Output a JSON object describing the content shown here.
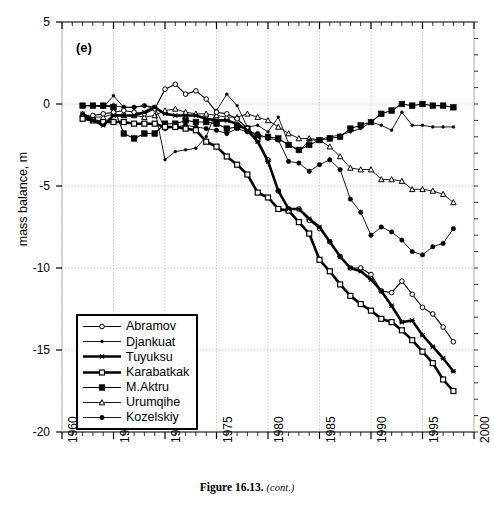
{
  "figure": {
    "panel_label": "(e)",
    "caption_number": "Figure 16.13.",
    "caption_cont": "(cont.)"
  },
  "axes": {
    "ylabel": "mass balance, m",
    "xlabel": "",
    "y_ticks": [
      "5",
      "0",
      "-5",
      "-10",
      "-15",
      "-20"
    ],
    "x_ticks": [
      "1960",
      "1965",
      "1970",
      "1975",
      "1980",
      "1985",
      "1990",
      "1995",
      "2000"
    ]
  },
  "legend": {
    "items": [
      {
        "label": "Abramov",
        "marker": "open-circle",
        "lw": 1.1,
        "ms": 4.6
      },
      {
        "label": "Djankuat",
        "marker": "small-dot",
        "lw": 0.9,
        "ms": 2.9
      },
      {
        "label": "Tuyuksu",
        "marker": "cross-x",
        "lw": 2.6,
        "ms": 4.2
      },
      {
        "label": "Karabatkak",
        "marker": "open-square",
        "lw": 2.6,
        "ms": 5.0
      },
      {
        "label": "M.Aktru",
        "marker": "filled-square",
        "lw": 1.1,
        "ms": 5.6
      },
      {
        "label": "Urumqihe",
        "marker": "open-triangle",
        "lw": 0.9,
        "ms": 4.6
      },
      {
        "label": "Kozelskiy",
        "marker": "filled-circle",
        "lw": 0.9,
        "ms": 4.4
      }
    ]
  },
  "chart_data": {
    "type": "line",
    "title": "",
    "subtitle": "",
    "xlabel": "",
    "ylabel": "mass balance, m",
    "xlim": [
      1960,
      2000
    ],
    "ylim": [
      -20,
      5
    ],
    "y_major_step": 5,
    "x_major_step": 5,
    "x_minor_step": 1,
    "grid": "dotted gridlines at major x and y values",
    "legend_position": "lower-left inside axes",
    "annotations": [
      "(e)"
    ],
    "series": [
      {
        "name": "Abramov",
        "color": "#000000",
        "marker": "open-circle",
        "x": [
          1962,
          1963,
          1964,
          1965,
          1966,
          1967,
          1968,
          1969,
          1970,
          1971,
          1972,
          1973,
          1974,
          1975,
          1976,
          1977,
          1978,
          1979,
          1980,
          1981,
          1982,
          1983,
          1984,
          1985,
          1986,
          1987,
          1988,
          1989,
          1990,
          1991,
          1992,
          1993,
          1994,
          1995,
          1996,
          1997,
          1998
        ],
        "y": [
          -0.8,
          -0.7,
          -0.6,
          -0.5,
          -0.4,
          -0.5,
          -0.6,
          -0.3,
          0.9,
          1.2,
          0.6,
          0.8,
          0.3,
          -0.5,
          -0.6,
          -0.9,
          -1.5,
          -2.2,
          -3.4,
          -5.3,
          -6.4,
          -6.4,
          -7.1,
          -7.6,
          -8.4,
          -9.3,
          -10.0,
          -10.0,
          -10.4,
          -11.4,
          -11.5,
          -10.8,
          -11.6,
          -12.4,
          -12.8,
          -13.6,
          -14.5
        ]
      },
      {
        "name": "Djankuat",
        "color": "#000000",
        "marker": "small-dot",
        "x": [
          1962,
          1963,
          1964,
          1965,
          1966,
          1967,
          1968,
          1969,
          1970,
          1971,
          1972,
          1973,
          1974,
          1975,
          1976,
          1977,
          1978,
          1979,
          1980,
          1981,
          1982,
          1983,
          1984,
          1985,
          1986,
          1987,
          1988,
          1989,
          1990,
          1991,
          1992,
          1993,
          1994,
          1995,
          1996,
          1997,
          1998
        ],
        "y": [
          -0.1,
          -0.1,
          -0.2,
          0.5,
          -0.2,
          -0.2,
          -0.1,
          -0.3,
          -3.4,
          -2.9,
          -2.8,
          -2.7,
          -2.0,
          -0.4,
          0.6,
          -0.1,
          -1.4,
          -1.3,
          -1.7,
          -0.8,
          -2.4,
          -2.9,
          -2.2,
          -2.2,
          -2.0,
          -1.9,
          -1.7,
          -1.5,
          -1.1,
          -1.3,
          -1.6,
          -0.5,
          -1.3,
          -1.3,
          -1.4,
          -1.4,
          -1.4
        ]
      },
      {
        "name": "Tuyuksu",
        "color": "#000000",
        "marker": "cross-x",
        "x": [
          1962,
          1963,
          1964,
          1965,
          1966,
          1967,
          1968,
          1969,
          1970,
          1971,
          1972,
          1973,
          1974,
          1975,
          1976,
          1977,
          1978,
          1979,
          1980,
          1981,
          1982,
          1983,
          1984,
          1985,
          1986,
          1987,
          1988,
          1989,
          1990,
          1991,
          1992,
          1993,
          1994,
          1995,
          1996,
          1997,
          1998
        ],
        "y": [
          -0.6,
          -1.0,
          -1.3,
          -0.7,
          -0.7,
          -0.7,
          -0.5,
          -0.2,
          -0.6,
          -0.7,
          -0.7,
          -0.7,
          -0.9,
          -1.0,
          -1.0,
          -1.2,
          -1.6,
          -2.3,
          -3.5,
          -5.3,
          -6.4,
          -6.4,
          -7.0,
          -7.5,
          -8.4,
          -9.3,
          -10.0,
          -10.2,
          -10.7,
          -11.4,
          -12.3,
          -13.3,
          -13.2,
          -14.1,
          -14.8,
          -15.5,
          -16.3
        ]
      },
      {
        "name": "Karabatkak",
        "color": "#000000",
        "marker": "open-square",
        "x": [
          1962,
          1963,
          1964,
          1965,
          1966,
          1967,
          1968,
          1969,
          1970,
          1971,
          1972,
          1973,
          1974,
          1975,
          1976,
          1977,
          1978,
          1979,
          1980,
          1981,
          1982,
          1983,
          1984,
          1985,
          1986,
          1987,
          1988,
          1989,
          1990,
          1991,
          1992,
          1993,
          1994,
          1995,
          1996,
          1997,
          1998
        ],
        "y": [
          -0.9,
          -1.0,
          -1.1,
          -1.1,
          -1.1,
          -1.2,
          -1.2,
          -1.2,
          -1.4,
          -1.4,
          -1.5,
          -1.6,
          -2.3,
          -2.6,
          -3.2,
          -3.7,
          -4.3,
          -5.4,
          -5.7,
          -6.4,
          -6.5,
          -7.2,
          -7.9,
          -9.5,
          -10.2,
          -11.0,
          -11.7,
          -12.2,
          -12.6,
          -13.1,
          -13.3,
          -13.8,
          -14.4,
          -15.1,
          -15.8,
          -16.8,
          -17.5
        ]
      },
      {
        "name": "M.Aktru",
        "color": "#000000",
        "marker": "filled-square",
        "x": [
          1962,
          1963,
          1964,
          1965,
          1966,
          1967,
          1968,
          1969,
          1970,
          1971,
          1972,
          1973,
          1974,
          1975,
          1976,
          1977,
          1978,
          1979,
          1980,
          1981,
          1982,
          1983,
          1984,
          1985,
          1986,
          1987,
          1988,
          1989,
          1990,
          1991,
          1992,
          1993,
          1994,
          1995,
          1996,
          1997,
          1998
        ],
        "y": [
          -0.1,
          -0.1,
          -0.1,
          -0.2,
          -1.8,
          -2.1,
          -1.8,
          -1.8,
          -1.2,
          -1.2,
          -1.0,
          -1.1,
          -1.1,
          -1.2,
          -1.5,
          -1.4,
          -1.5,
          -2.0,
          -2.0,
          -2.1,
          -2.5,
          -2.8,
          -2.5,
          -2.2,
          -2.1,
          -2.0,
          -1.5,
          -1.3,
          -1.1,
          -0.6,
          -0.4,
          0.0,
          -0.1,
          0.0,
          -0.1,
          -0.1,
          -0.2
        ]
      },
      {
        "name": "Urumqihe",
        "color": "#000000",
        "marker": "open-triangle",
        "x": [
          1962,
          1963,
          1964,
          1965,
          1966,
          1967,
          1968,
          1969,
          1970,
          1971,
          1972,
          1973,
          1974,
          1975,
          1976,
          1977,
          1978,
          1979,
          1980,
          1981,
          1982,
          1983,
          1984,
          1985,
          1986,
          1987,
          1988,
          1989,
          1990,
          1991,
          1992,
          1993,
          1994,
          1995,
          1996,
          1997,
          1998
        ],
        "y": [
          -0.6,
          -0.8,
          -0.8,
          -0.6,
          -0.7,
          -0.7,
          -0.8,
          -0.7,
          -0.4,
          -0.3,
          -0.5,
          -0.6,
          -0.6,
          -0.7,
          -0.8,
          -0.8,
          -0.6,
          -0.8,
          -1.0,
          -1.4,
          -1.8,
          -2.1,
          -2.1,
          -2.2,
          -2.6,
          -3.2,
          -3.9,
          -4.0,
          -4.0,
          -4.6,
          -4.6,
          -4.7,
          -5.2,
          -5.2,
          -5.3,
          -5.5,
          -6.0
        ]
      },
      {
        "name": "Kozelskiy",
        "color": "#000000",
        "marker": "filled-circle",
        "x": [
          1962,
          1963,
          1964,
          1965,
          1966,
          1967,
          1968,
          1969,
          1970,
          1971,
          1972,
          1973,
          1974,
          1975,
          1976,
          1977,
          1978,
          1979,
          1980,
          1981,
          1982,
          1983,
          1984,
          1985,
          1986,
          1987,
          1988,
          1989,
          1990,
          1991,
          1992,
          1993,
          1994,
          1995,
          1996,
          1997,
          1998
        ],
        "y": [
          -0.1,
          -0.1,
          -0.1,
          -0.1,
          -0.2,
          -0.2,
          -0.1,
          -0.2,
          -1.5,
          -1.4,
          -1.3,
          -1.4,
          -1.5,
          -1.6,
          -1.8,
          -1.5,
          -1.7,
          -1.8,
          -2.1,
          -2.2,
          -3.5,
          -3.6,
          -4.1,
          -3.7,
          -3.4,
          -4.0,
          -5.8,
          -6.6,
          -8.0,
          -7.5,
          -7.8,
          -8.3,
          -9.0,
          -9.2,
          -8.7,
          -8.5,
          -7.6
        ]
      }
    ]
  }
}
